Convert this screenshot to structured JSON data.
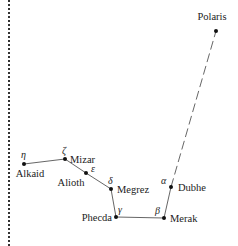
{
  "diagram": {
    "stars": [
      {
        "name": "Polaris",
        "greek": "",
        "x": 216,
        "y": 31
      },
      {
        "name": "Dubhe",
        "greek": "α",
        "x": 171,
        "y": 187
      },
      {
        "name": "Merak",
        "greek": "β",
        "x": 164,
        "y": 218
      },
      {
        "name": "Phecda",
        "greek": "γ",
        "x": 116,
        "y": 217
      },
      {
        "name": "Megrez",
        "greek": "δ",
        "x": 111,
        "y": 189
      },
      {
        "name": "Alioth",
        "greek": "ε",
        "x": 86,
        "y": 173
      },
      {
        "name": "Mizar",
        "greek": "ζ",
        "x": 65,
        "y": 159
      },
      {
        "name": "Alkaid",
        "greek": "η",
        "x": 24,
        "y": 164
      }
    ],
    "labels": {
      "polaris": "Polaris",
      "dubhe": "Dubhe",
      "dubhe_greek": "α",
      "merak": "Merak",
      "merak_greek": "β",
      "phecda": "Phecda",
      "phecda_greek": "γ",
      "megrez": "Megrez",
      "megrez_greek": "δ",
      "alioth": "Alioth",
      "alioth_greek": "ε",
      "mizar": "Mizar",
      "mizar_greek": "ζ",
      "alkaid": "Alkaid",
      "alkaid_greek": "η"
    },
    "colors": {
      "line": "#444444",
      "star": "#111111",
      "text": "#222222"
    }
  }
}
